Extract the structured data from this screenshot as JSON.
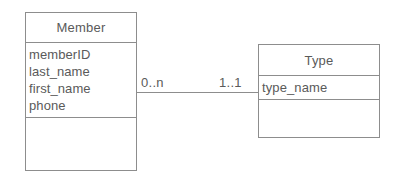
{
  "diagram": {
    "type": "uml-class-diagram",
    "colors": {
      "line": "#8d8d8d",
      "text": "#5a5a5a",
      "background": "#ffffff"
    },
    "entities": [
      {
        "id": "member",
        "name": "Member",
        "attributes": [
          "memberID",
          "last_name",
          "first_name",
          "phone"
        ],
        "operations": []
      },
      {
        "id": "type",
        "name": "Type",
        "attributes": [
          "type_name"
        ],
        "operations": []
      }
    ],
    "association": {
      "source_entity": "Member",
      "target_entity": "Type",
      "source_multiplicity": "0..n",
      "target_multiplicity": "1..1"
    }
  }
}
